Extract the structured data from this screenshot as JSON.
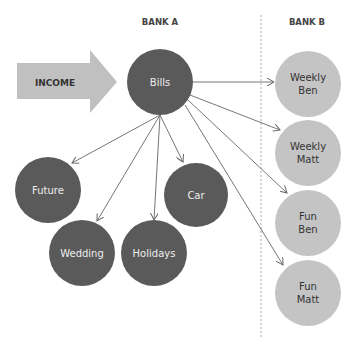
{
  "headers": {
    "bank_a": "BANK A",
    "bank_b": "BANK B"
  },
  "income": {
    "label": "INCOME"
  },
  "colors": {
    "dark": "#5a5a5a",
    "light": "#c4c4c4",
    "arrow_fill": "#c0c0c0",
    "line": "#666666"
  },
  "nodes": {
    "bills": "Bills",
    "future": "Future",
    "car": "Car",
    "wedding": "Wedding",
    "holidays": "Holidays",
    "weekly_ben_1": "Weekly",
    "weekly_ben_2": "Ben",
    "weekly_matt_1": "Weekly",
    "weekly_matt_2": "Matt",
    "fun_ben_1": "Fun",
    "fun_ben_2": "Ben",
    "fun_matt_1": "Fun",
    "fun_matt_2": "Matt"
  }
}
